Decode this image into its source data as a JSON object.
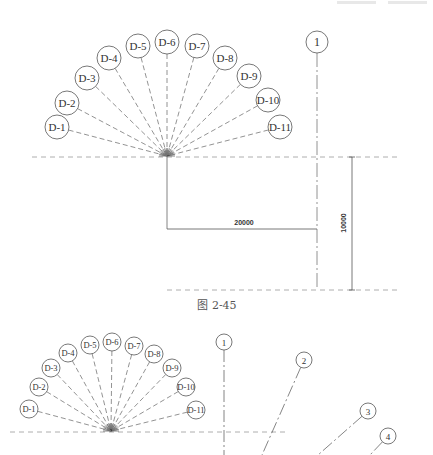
{
  "figure_top": {
    "caption": "图 2-45",
    "fan_center": [
      167,
      156
    ],
    "radial_axes": [
      {
        "label": "D-1",
        "cx": 57,
        "cy": 127,
        "r": 12
      },
      {
        "label": "D-2",
        "cx": 67,
        "cy": 103,
        "r": 12
      },
      {
        "label": "D-3",
        "cx": 87,
        "cy": 78,
        "r": 12
      },
      {
        "label": "D-4",
        "cx": 109,
        "cy": 58,
        "r": 12
      },
      {
        "label": "D-5",
        "cx": 138,
        "cy": 46,
        "r": 12
      },
      {
        "label": "D-6",
        "cx": 167,
        "cy": 42,
        "r": 12
      },
      {
        "label": "D-7",
        "cx": 197,
        "cy": 46,
        "r": 12
      },
      {
        "label": "D-8",
        "cx": 225,
        "cy": 58,
        "r": 12
      },
      {
        "label": "D-9",
        "cx": 249,
        "cy": 76,
        "r": 12
      },
      {
        "label": "D-10",
        "cx": 268,
        "cy": 100,
        "r": 12
      },
      {
        "label": "D-11",
        "cx": 280,
        "cy": 127,
        "r": 12
      }
    ],
    "grid_axis": {
      "label": "1",
      "cx": 317,
      "cy": 42,
      "r": 11
    },
    "dimension_horizontal": "20000",
    "dimension_vertical": "10000"
  },
  "figure_bottom": {
    "fan_center": [
      111,
      431
    ],
    "radial_axes": [
      {
        "label": "D-1",
        "cx": 29,
        "cy": 409,
        "r": 9
      },
      {
        "label": "D-2",
        "cx": 39,
        "cy": 387,
        "r": 9
      },
      {
        "label": "D-3",
        "cx": 51,
        "cy": 368,
        "r": 9
      },
      {
        "label": "D-4",
        "cx": 68,
        "cy": 353,
        "r": 9
      },
      {
        "label": "D-5",
        "cx": 90,
        "cy": 345,
        "r": 9
      },
      {
        "label": "D-6",
        "cx": 112,
        "cy": 342,
        "r": 9
      },
      {
        "label": "D-7",
        "cx": 134,
        "cy": 346,
        "r": 9
      },
      {
        "label": "D-8",
        "cx": 154,
        "cy": 354,
        "r": 9
      },
      {
        "label": "D-9",
        "cx": 172,
        "cy": 368,
        "r": 9
      },
      {
        "label": "D-10",
        "cx": 186,
        "cy": 387,
        "r": 9
      },
      {
        "label": "D-11",
        "cx": 196,
        "cy": 410,
        "r": 9
      }
    ],
    "grid_axes": [
      {
        "label": "1",
        "cx": 224,
        "cy": 342,
        "r": 8,
        "x2": 224,
        "y2": 455
      },
      {
        "label": "2",
        "cx": 304,
        "cy": 360,
        "r": 8,
        "x2": 262,
        "y2": 455
      },
      {
        "label": "3",
        "cx": 368,
        "cy": 411,
        "r": 8,
        "x2": 318,
        "y2": 455
      },
      {
        "label": "4",
        "cx": 388,
        "cy": 436,
        "r": 8,
        "x2": 370,
        "y2": 455
      }
    ]
  }
}
